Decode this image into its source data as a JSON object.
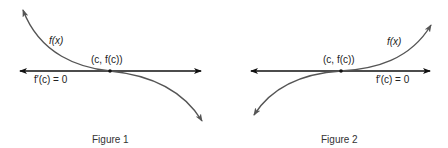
{
  "figures": [
    {
      "caption": "Figure 1",
      "curve_label": "f(x)",
      "point_label": "(c, f(c))",
      "tangent_label": "f′(c) = 0",
      "description": "decreasing curve with horizontal tangent at inflection point"
    },
    {
      "caption": "Figure 2",
      "curve_label": "f(x)",
      "point_label": "(c, f(c))",
      "tangent_label": "f′(c) = 0",
      "description": "increasing curve with horizontal tangent at inflection point"
    }
  ],
  "colors": {
    "axis": "#111111",
    "curve": "#555555",
    "text": "#222222"
  }
}
